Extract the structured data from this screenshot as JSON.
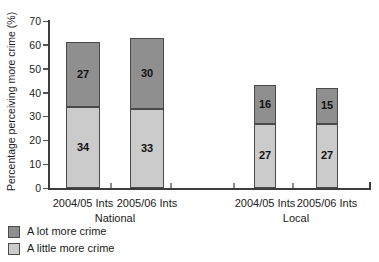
{
  "chart_data": {
    "type": "bar",
    "subtype": "stacked",
    "title": "",
    "ylabel": "Percentage perceiving more crime (%)",
    "xlabel": "",
    "ylim": [
      0,
      70
    ],
    "yticks": [
      0,
      10,
      20,
      30,
      40,
      50,
      60,
      70
    ],
    "grid": false,
    "legend_position": "bottom-left",
    "categories": [
      "2004/05 Ints",
      "2005/06 Ints",
      "2004/05 Ints",
      "2005/06 Ints"
    ],
    "groups": [
      {
        "label": "National",
        "category_indexes": [
          0,
          1
        ]
      },
      {
        "label": "Local",
        "category_indexes": [
          2,
          3
        ]
      }
    ],
    "series": [
      {
        "name": "A lot more crime",
        "color": "#8f8f8f",
        "values": [
          27,
          30,
          16,
          15
        ]
      },
      {
        "name": "A little more crime",
        "color": "#cbcbcb",
        "values": [
          34,
          33,
          27,
          27
        ]
      }
    ]
  },
  "colors": {
    "axis": "#3d3d3d",
    "bar_border": "#4a4a4a",
    "text": "#1b1b1b",
    "background": "#ffffff"
  }
}
